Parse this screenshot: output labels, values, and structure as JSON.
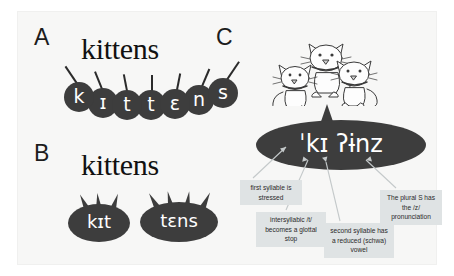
{
  "figure": {
    "background_color": "#f7f7f6",
    "bubble_color": "#3d3d3d",
    "callout_color": "#dfe3e4"
  },
  "panels": {
    "a": {
      "letter": "A",
      "orthographic_word": "kittens",
      "phones": [
        {
          "symbol": "k"
        },
        {
          "symbol": "ɪ"
        },
        {
          "symbol": "t"
        },
        {
          "symbol": "t"
        },
        {
          "symbol": "ɛ"
        },
        {
          "symbol": "n"
        },
        {
          "symbol": "s"
        }
      ]
    },
    "b": {
      "letter": "B",
      "orthographic_word": "kittens",
      "syllables": [
        {
          "symbol": "kɪt",
          "spikes": 3
        },
        {
          "symbol": "tɛns",
          "spikes": 4
        }
      ]
    },
    "c": {
      "letter": "C",
      "illustration": "three-kittens",
      "transcription": "ˈkɪ ʔɨnz",
      "callouts": [
        {
          "id": "stress",
          "text": "first syllable is stressed"
        },
        {
          "id": "glottal",
          "text": "intersyllabic /t/ becomes a glottal stop"
        },
        {
          "id": "schwa",
          "text": "second syllable has a reduced (schwa) vowel"
        },
        {
          "id": "plural",
          "text": "The plural S has the /z/ pronunciation"
        }
      ]
    }
  }
}
